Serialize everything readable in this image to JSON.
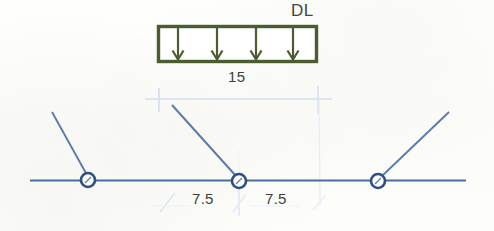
{
  "diagram": {
    "title_label": "DL",
    "labels": {
      "load_name": "DL",
      "total_span": "15",
      "half_span_left": "7.5",
      "half_span_right": "7.5"
    },
    "colors": {
      "load_box_stroke": "#4d5c2e",
      "load_arrow": "#4d5c2e",
      "member_line": "#4a6d9e",
      "joint_stroke": "#2f4f82",
      "dimension_line": "#cdd9ea",
      "background": "#fdfdfb",
      "text": "#3f3f3f"
    },
    "load_block": {
      "name": "distributed-dead-load",
      "x": 158,
      "y": 26,
      "width": 159,
      "height": 36,
      "arrow_count": 4,
      "arrow_direction": "down"
    },
    "beam": {
      "name": "horizontal-beam",
      "x1": 30,
      "y1": 180,
      "x2": 466,
      "y2": 180
    },
    "joints": [
      {
        "name": "support-joint-left",
        "cx": 88,
        "cy": 180,
        "r": 7
      },
      {
        "name": "support-joint-middle",
        "cx": 239,
        "cy": 181,
        "r": 7
      },
      {
        "name": "support-joint-right",
        "cx": 378,
        "cy": 181,
        "r": 7
      }
    ],
    "diagonals": [
      {
        "name": "diagonal-member-left",
        "x1": 52,
        "y1": 112,
        "x2": 87,
        "y2": 175
      },
      {
        "name": "diagonal-member-middle",
        "x1": 172,
        "y1": 105,
        "x2": 236,
        "y2": 176
      },
      {
        "name": "diagonal-member-right",
        "x1": 382,
        "y1": 176,
        "x2": 449,
        "y2": 112
      }
    ],
    "dimensions": {
      "top": {
        "name": "span-dimension-top",
        "y": 99,
        "x1": 145,
        "x2": 332,
        "ticks_x": [
          159,
          318
        ],
        "value": "15"
      },
      "bottom": {
        "name": "span-dimension-bottom",
        "left_tick_x": 166,
        "center_tick_x": 239,
        "right_tick_x": 320,
        "y_top": 188,
        "y_bottom": 214,
        "value_left": "7.5",
        "value_right": "7.5"
      }
    }
  }
}
